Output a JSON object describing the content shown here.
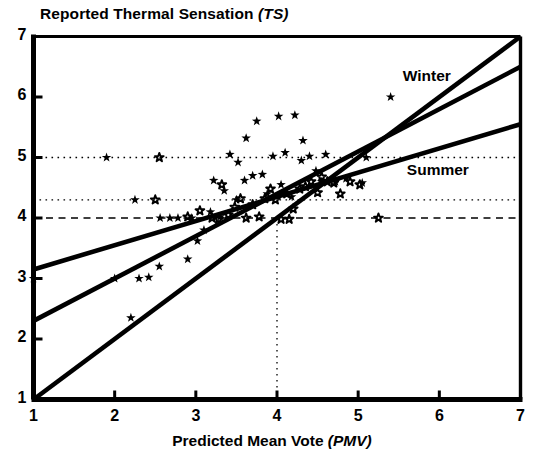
{
  "chart_data": {
    "type": "scatter",
    "title": "Reported Thermal Sensation (TS)",
    "title_plain": "Reported Thermal Sensation",
    "title_italic": "(TS)",
    "xlabel_plain": "Predicted Mean Vote",
    "xlabel_italic": "(PMV)",
    "ylabel": "Reported Thermal Sensation (TS)",
    "xlim": [
      1,
      7
    ],
    "ylim": [
      1,
      7
    ],
    "xticks": [
      1,
      2,
      3,
      4,
      5,
      6,
      7
    ],
    "yticks": [
      1,
      2,
      3,
      4,
      5,
      6,
      7
    ],
    "grid": false,
    "legend_position": "inline-annotations",
    "annotations": [
      {
        "text": "Winter",
        "x": 5.55,
        "y": 6.33
      },
      {
        "text": "Summer",
        "x": 5.6,
        "y": 4.78
      }
    ],
    "series": [
      {
        "name": "Winter",
        "marker": "filled-star",
        "points": [
          [
            1.0,
            3.0
          ],
          [
            1.9,
            5.0
          ],
          [
            2.0,
            3.0
          ],
          [
            2.2,
            2.35
          ],
          [
            2.25,
            4.3
          ],
          [
            2.3,
            3.0
          ],
          [
            2.42,
            3.02
          ],
          [
            2.55,
            3.2
          ],
          [
            2.56,
            4.0
          ],
          [
            2.68,
            4.0
          ],
          [
            2.78,
            4.0
          ],
          [
            2.9,
            3.32
          ],
          [
            2.95,
            4.0
          ],
          [
            3.02,
            3.62
          ],
          [
            3.1,
            3.8
          ],
          [
            3.18,
            4.1
          ],
          [
            3.22,
            4.62
          ],
          [
            3.3,
            4.02
          ],
          [
            3.35,
            4.45
          ],
          [
            3.42,
            5.05
          ],
          [
            3.5,
            4.3
          ],
          [
            3.52,
            4.92
          ],
          [
            3.6,
            4.62
          ],
          [
            3.62,
            5.32
          ],
          [
            3.7,
            4.7
          ],
          [
            3.75,
            5.6
          ],
          [
            3.82,
            4.72
          ],
          [
            3.88,
            4.4
          ],
          [
            3.95,
            5.02
          ],
          [
            4.02,
            5.68
          ],
          [
            4.05,
            4.55
          ],
          [
            4.1,
            5.08
          ],
          [
            4.18,
            4.35
          ],
          [
            4.22,
            5.7
          ],
          [
            4.3,
            4.95
          ],
          [
            4.32,
            5.28
          ],
          [
            4.4,
            5.02
          ],
          [
            4.48,
            4.78
          ],
          [
            4.55,
            4.6
          ],
          [
            4.6,
            5.05
          ],
          [
            4.72,
            4.6
          ],
          [
            4.85,
            4.65
          ],
          [
            5.05,
            4.58
          ],
          [
            5.1,
            5.0
          ],
          [
            5.4,
            6.0
          ]
        ]
      },
      {
        "name": "Summer",
        "marker": "open-circle",
        "points": [
          [
            2.5,
            4.3
          ],
          [
            2.55,
            5.0
          ],
          [
            2.9,
            4.02
          ],
          [
            3.05,
            4.12
          ],
          [
            3.2,
            4.0
          ],
          [
            3.28,
            3.98
          ],
          [
            3.4,
            4.05
          ],
          [
            3.48,
            4.18
          ],
          [
            3.55,
            4.32
          ],
          [
            3.62,
            4.0
          ],
          [
            3.7,
            4.22
          ],
          [
            3.78,
            4.02
          ],
          [
            3.85,
            4.32
          ],
          [
            3.92,
            4.48
          ],
          [
            3.98,
            4.3
          ],
          [
            4.05,
            3.98
          ],
          [
            4.12,
            4.4
          ],
          [
            4.2,
            4.15
          ],
          [
            4.28,
            4.48
          ],
          [
            4.35,
            4.52
          ],
          [
            4.42,
            4.6
          ],
          [
            4.5,
            4.42
          ],
          [
            4.55,
            4.68
          ],
          [
            4.62,
            4.6
          ],
          [
            4.7,
            4.58
          ],
          [
            4.78,
            4.4
          ],
          [
            4.9,
            4.6
          ],
          [
            5.02,
            4.55
          ],
          [
            5.25,
            4.0
          ],
          [
            4.15,
            3.98
          ],
          [
            3.32,
            4.55
          ]
        ]
      }
    ],
    "fit_lines": [
      {
        "name": "winter-fit",
        "x0": 1.0,
        "y0": 2.3,
        "x1": 7.0,
        "y1": 6.5
      },
      {
        "name": "summer-fit",
        "x0": 1.0,
        "y0": 3.15,
        "x1": 7.0,
        "y1": 5.55
      },
      {
        "name": "identity-line",
        "x0": 1.0,
        "y0": 1.0,
        "x1": 7.0,
        "y1": 7.0
      }
    ],
    "reference_lines": [
      {
        "name": "ts-5-dotted",
        "orientation": "horizontal",
        "value": 5.0,
        "style": "dotted",
        "x0": 1.0,
        "x1": 7.0
      },
      {
        "name": "ts-4-3-dotted",
        "orientation": "horizontal",
        "value": 4.3,
        "style": "dotted",
        "x0": 1.0,
        "x1": 7.0
      },
      {
        "name": "ts-4-dashed",
        "orientation": "horizontal",
        "value": 4.0,
        "style": "dashed",
        "x0": 1.0,
        "x1": 7.0
      },
      {
        "name": "pmv-4-dotted",
        "orientation": "vertical",
        "value": 4.0,
        "style": "dotted",
        "y0": 1.0,
        "y1": 4.0
      }
    ]
  },
  "colors": {
    "line": "#000000",
    "axis": "#000000",
    "background": "#ffffff"
  }
}
